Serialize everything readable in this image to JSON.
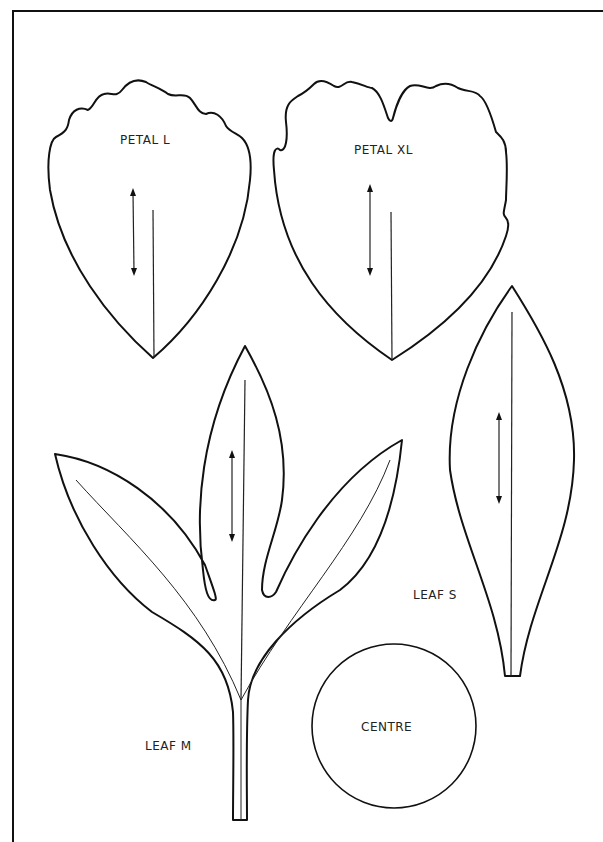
{
  "page": {
    "type": "paper flower cut-out template",
    "colors": {
      "line": "#111111",
      "background": "#ffffff"
    }
  },
  "pieces": [
    {
      "id": "petal-l",
      "label": "PETAL L",
      "has_grain_arrow": true
    },
    {
      "id": "petal-xl",
      "label": "PETAL XL",
      "has_grain_arrow": true
    },
    {
      "id": "leaf-m",
      "label": "LEAF M",
      "has_grain_arrow": true
    },
    {
      "id": "leaf-s",
      "label": "LEAF S",
      "has_grain_arrow": true
    },
    {
      "id": "centre",
      "label": "CENTRE",
      "has_grain_arrow": false
    }
  ]
}
